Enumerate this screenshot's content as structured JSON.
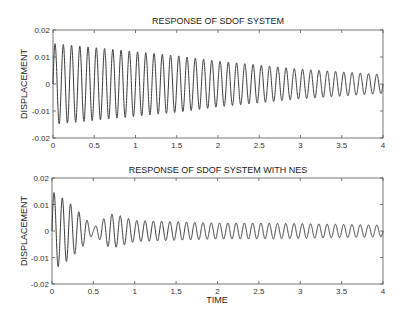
{
  "chart_data": [
    {
      "type": "line",
      "title": "RESPONSE OF SDOF SYSTEM",
      "xlabel": "",
      "ylabel": "DISPLACEMENT",
      "xlim": [
        0,
        4
      ],
      "ylim": [
        -0.02,
        0.02
      ],
      "xticks": [
        "0",
        "0.5",
        "1",
        "1.5",
        "2",
        "2.5",
        "3",
        "3.5",
        "4"
      ],
      "yticks": [
        "0.02",
        "0.01",
        "0",
        "-0.01",
        "-0.02"
      ],
      "grid": false,
      "series": [
        {
          "name": "SDOF displacement",
          "description": "lightly damped sinusoid, ~10 Hz, ~40 cycles over 4 s",
          "frequency_hz": 10,
          "envelope": {
            "t": [
              0,
              0.5,
              1,
              1.5,
              2,
              2.5,
              3,
              3.5,
              4
            ],
            "amplitude": [
              0.015,
              0.0135,
              0.012,
              0.0105,
              0.0085,
              0.007,
              0.0055,
              0.0045,
              0.0035
            ]
          }
        }
      ]
    },
    {
      "type": "line",
      "title": "RESPONSE OF SDOF SYSTEM WITH NES",
      "xlabel": "TIME",
      "ylabel": "DISPLACEMENT",
      "xlim": [
        0,
        4
      ],
      "ylim": [
        -0.02,
        0.02
      ],
      "xticks": [
        "0",
        "0.5",
        "1",
        "1.5",
        "2",
        "2.5",
        "3",
        "3.5",
        "4"
      ],
      "yticks": [
        "0.02",
        "0.01",
        "0",
        "-0.01",
        "-0.02"
      ],
      "grid": false,
      "series": [
        {
          "name": "SDOF displacement with NES",
          "description": "rapid initial decay with beating near t=0.5, then small ~10 Hz oscillation",
          "frequency_hz": 10,
          "envelope": {
            "t": [
              0,
              0.1,
              0.2,
              0.3,
              0.4,
              0.5,
              0.6,
              0.7,
              0.8,
              1.0,
              1.5,
              2,
              2.5,
              3,
              3.5,
              4
            ],
            "amplitude": [
              0.015,
              0.013,
              0.011,
              0.008,
              0.005,
              0.0012,
              0.004,
              0.0065,
              0.006,
              0.004,
              0.0035,
              0.003,
              0.003,
              0.0028,
              0.0025,
              0.0022
            ]
          }
        }
      ]
    }
  ]
}
